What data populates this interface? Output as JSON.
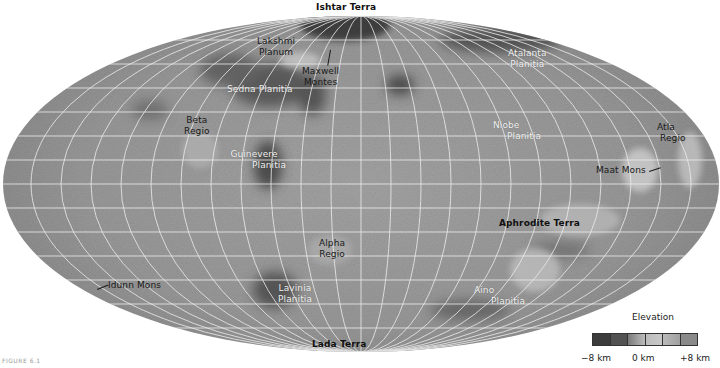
{
  "map": {
    "projection": "equal-area ellipse",
    "body": "Venus",
    "colors": {
      "background": "#ffffff",
      "surface_mid": "#9a9a9a",
      "surface_light": "#bdbdbd",
      "surface_dark": "#4a4a4a",
      "graticule": "#e8e8e8"
    }
  },
  "labels": {
    "ishtar_terra": "Ishtar Terra",
    "lakshmi_planum_1": "Lakshmi",
    "lakshmi_planum_2": "Planum",
    "maxwell_montes_1": "Maxwell",
    "maxwell_montes_2": "Montes",
    "sedna_planitia": "Sedna Planitia",
    "beta_regio_1": "Beta",
    "beta_regio_2": "Regio",
    "guinevere_planitia_1": "Guinevere",
    "guinevere_planitia_2": "Planitia",
    "atalanta_planitia_1": "Atalanta",
    "atalanta_planitia_2": "Planitia",
    "niobe_planitia_1": "Niobe",
    "niobe_planitia_2": "Planitia",
    "atla_regio_1": "Atla",
    "atla_regio_2": "Regio",
    "maat_mons": "Maat Mons",
    "aphrodite_terra": "Aphrodite Terra",
    "alpha_regio_1": "Alpha",
    "alpha_regio_2": "Regio",
    "lavinia_planitia_1": "Lavinia",
    "lavinia_planitia_2": "Planitia",
    "aino_planitia_1": "Aino",
    "aino_planitia_2": "Planitia",
    "idunn_mons": "Idunn Mons",
    "lada_terra": "Lada Terra"
  },
  "legend": {
    "title": "Elevation",
    "ticks": [
      "−8 km",
      "0 km",
      "+8 km"
    ],
    "colors": [
      "#3c3c3c",
      "#5a5a5a",
      "#8e8e8e",
      "#bdbdbd",
      "#c9c9c9",
      "#a2a2a2",
      "#8a8a8a"
    ]
  },
  "caption": {
    "figure_label": "FIGURE 6.1"
  }
}
